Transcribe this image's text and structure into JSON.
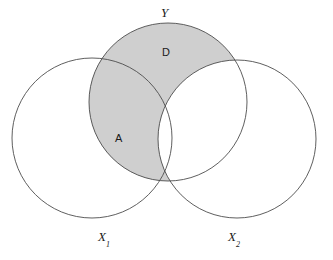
{
  "figure": {
    "type": "venn-diagram",
    "title": "",
    "background_color": "#ffffff",
    "width": 333,
    "height": 260
  },
  "style": {
    "shade_color": "#cfcfcf",
    "stroke_color": "#4d4d4d",
    "stroke_width": 0.9,
    "text_color": "#1a1a1a"
  },
  "sets": {
    "x1": {
      "label": "X",
      "subscript": "1",
      "cx": 92,
      "cy": 138,
      "r": 80,
      "fill": "none"
    },
    "x2": {
      "label": "X",
      "subscript": "2",
      "cx": 237,
      "cy": 139,
      "r": 79,
      "fill": "none"
    },
    "y": {
      "label": "Y",
      "subscript": "",
      "cx": 168,
      "cy": 102,
      "r": 79,
      "fill": "shaded"
    }
  },
  "regions": [
    {
      "id": "D",
      "label": "D",
      "description": "Y minus X2, upper shaded lune",
      "shaded": true
    },
    {
      "id": "A",
      "label": "A",
      "description": "Y intersect X1 minus X2, lower shaded lens",
      "shaded": true
    }
  ],
  "chart_data": {
    "type": "diagram",
    "title": "",
    "sets": [
      "X1",
      "X2",
      "Y"
    ],
    "shaded_regions": [
      "D",
      "A"
    ],
    "labels": [
      "Y",
      "D",
      "A",
      "X1",
      "X2"
    ]
  }
}
